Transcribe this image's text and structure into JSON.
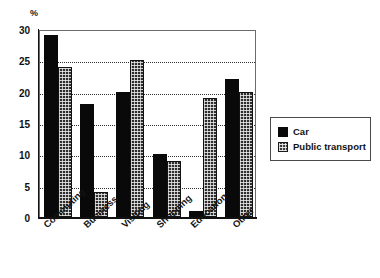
{
  "chart_data": {
    "type": "bar",
    "title": "",
    "subtitle": "",
    "xlabel": "",
    "ylabel": "%",
    "ylim": [
      0,
      30
    ],
    "yticks": [
      0,
      5,
      10,
      15,
      20,
      25,
      30
    ],
    "ytick_labels": [
      "0",
      "5",
      "10",
      "15",
      "20",
      "25",
      "30"
    ],
    "grid": true,
    "grid_style": "dotted-horizontal",
    "legend_position": "right",
    "categories": [
      "Commuting",
      "Business",
      "Visiting",
      "Shopping",
      "Education",
      "Other"
    ],
    "series": [
      {
        "name": "Car",
        "color": "#090909",
        "pattern": "solid",
        "values": [
          29,
          18,
          20,
          10,
          1,
          22
        ]
      },
      {
        "name": "Public transport",
        "color": "#2e2e2e",
        "pattern": "cross-hatch",
        "values": [
          24,
          4,
          25,
          9,
          19,
          20
        ]
      }
    ]
  },
  "legend": {
    "items": [
      {
        "label": "Car",
        "swatch": "car"
      },
      {
        "label": "Public transport",
        "swatch": "pt"
      }
    ]
  }
}
